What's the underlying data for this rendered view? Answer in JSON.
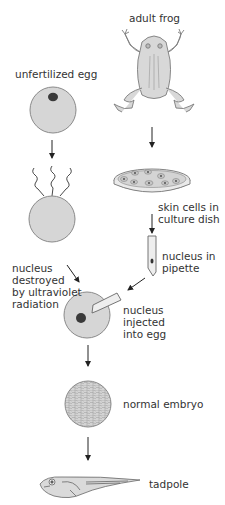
{
  "diagram": {
    "type": "flowchart",
    "topic": "nuclear transfer cloning in frogs",
    "colors": {
      "cell_fill": "#d6d6d6",
      "cell_stroke": "#7a7a7a",
      "nucleus": "#3a3a3a",
      "arrow": "#222222",
      "text": "#333333"
    },
    "nodes": [
      {
        "id": "adult_frog",
        "label": "adult frog"
      },
      {
        "id": "unfertilized_egg",
        "label": "unfertilized egg"
      },
      {
        "id": "skin_cells",
        "label": "skin cells in\nculture dish"
      },
      {
        "id": "nucleus_pipette",
        "label": "nucleus in\npipette"
      },
      {
        "id": "nucleus_destroyed",
        "label": "nucleus\ndestroyed\nby ultraviolet\nradiation"
      },
      {
        "id": "nucleus_injected",
        "label": "nucleus\ninjected\ninto egg"
      },
      {
        "id": "normal_embryo",
        "label": "normal embryo"
      },
      {
        "id": "tadpole",
        "label": "tadpole"
      }
    ],
    "edges": [
      {
        "from": "adult_frog",
        "to": "skin_cells"
      },
      {
        "from": "skin_cells",
        "to": "nucleus_pipette"
      },
      {
        "from": "unfertilized_egg",
        "to": "nucleus_destroyed"
      },
      {
        "from": "nucleus_destroyed",
        "to": "nucleus_injected"
      },
      {
        "from": "nucleus_pipette",
        "to": "nucleus_injected"
      },
      {
        "from": "nucleus_injected",
        "to": "normal_embryo"
      },
      {
        "from": "normal_embryo",
        "to": "tadpole"
      }
    ]
  },
  "labels": {
    "adult_frog": "adult frog",
    "unfertilized_egg": "unfertilized egg",
    "skin_cells": "skin cells in\nculture dish",
    "nucleus_pipette": "nucleus in\npipette",
    "nucleus_destroyed": "nucleus\ndestroyed\nby ultraviolet\nradiation",
    "nucleus_injected": "nucleus\ninjected\ninto egg",
    "normal_embryo": "normal embryo",
    "tadpole": "tadpole"
  }
}
